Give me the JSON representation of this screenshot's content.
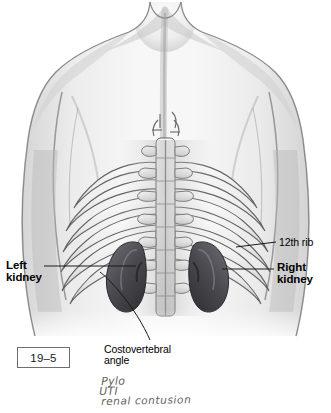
{
  "figure": {
    "number": "19–5"
  },
  "labels": {
    "left_kidney": "Left\nkidney",
    "right_kidney": "Right\nkidney",
    "twelfth_rib": "12th rib",
    "costovertebral_angle": "Costovertebral\nangle"
  },
  "handwriting": {
    "line1": "Pylo",
    "line2": "UTI",
    "line3": "renal contusion"
  },
  "colors": {
    "background": "#ffffff",
    "ink": "#000000",
    "skin_light": "#f2f2f2",
    "skin_mid": "#d8d8d8",
    "skin_shadow": "#9e9e9e",
    "bone": "#efefef",
    "bone_line": "#4a4a4a",
    "kidney_dark": "#3f3f43",
    "kidney_mid": "#5c5c61",
    "leader_line": "#1a1a1a",
    "fig_box_border": "#6e6e6e",
    "handwriting": "#4c4c4c"
  },
  "artwork": {
    "type": "grayscale-anatomical-illustration",
    "view": "posterior",
    "subject": "human-upper-back-torso",
    "structures": [
      "neck",
      "shoulders",
      "left-arm",
      "right-arm",
      "upper-back",
      "vertebral-column",
      "thoracic-vertebrae",
      "transverse-processes",
      "rib-pairs",
      "12th-rib",
      "left-kidney",
      "right-kidney",
      "costovertebral-angle"
    ],
    "rib_pair_count": 6
  }
}
